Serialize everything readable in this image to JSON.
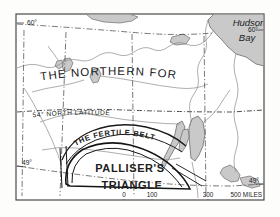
{
  "map": {
    "title": "Palliser's Triangle and the Fertile Belt",
    "background_color": "#fdfdfc",
    "ink_color": "#202020",
    "water_fill_color": "#c9c9c9",
    "graticule_color": "#555555",
    "regions": {
      "northern_forest": "THE NORTHERN FOREST",
      "fertile_belt": "THE FERTILE BELT",
      "palliser_line1": "PALLISER'S",
      "palliser_line2": "TRIANGLE"
    },
    "water_bodies": {
      "hudson_bay_line1": "Hudson",
      "hudson_bay_line2": "Bay"
    },
    "graticule_labels": {
      "lat60_left": "60°",
      "lat60_right": "60°",
      "lat49_left": "49°",
      "lat49_right": "49°",
      "lat54_annotation": "54° NORTH LATITUDE"
    },
    "scale_bar": {
      "ticks": [
        "0",
        "100",
        "300"
      ],
      "end_label": "500 MILES"
    }
  }
}
